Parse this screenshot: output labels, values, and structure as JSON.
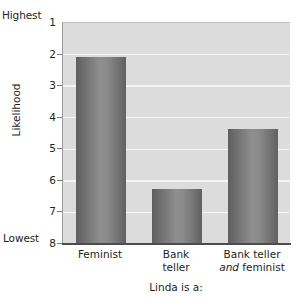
{
  "chart_data": {
    "type": "bar",
    "title": "",
    "subtitle": "",
    "xlabel": "Linda is a:",
    "ylabel": "Likelihood",
    "categories": [
      "Feminist",
      "Bank teller",
      "Bank teller and feminist"
    ],
    "values": [
      2.1,
      6.3,
      4.4
    ],
    "ylim": [
      1,
      8
    ],
    "y_axis_inverted": true,
    "y_tick_labels": [
      "1",
      "2",
      "3",
      "4",
      "5",
      "6",
      "7",
      "8"
    ],
    "y_axis_top_caption": "Highest",
    "y_axis_bottom_caption": "Lowest",
    "grid": true,
    "legend": "none",
    "series": [
      {
        "name": "Likelihood rating",
        "values": [
          2.1,
          6.3,
          4.4
        ]
      }
    ],
    "annotations": [],
    "plot_background_color": "#dcdcdc",
    "gridline_color": "#f4f4f4",
    "bar_color_dark": "#5e5e5e",
    "bar_color_light": "#8e8e8e"
  },
  "axis": {
    "highest_caption": "Highest",
    "lowest_caption": "Lowest",
    "y_title": "Likelihood",
    "x_title": "Linda is a:",
    "ticks": [
      {
        "label": "1",
        "value": 1
      },
      {
        "label": "2",
        "value": 2
      },
      {
        "label": "3",
        "value": 3
      },
      {
        "label": "4",
        "value": 4
      },
      {
        "label": "5",
        "value": 5
      },
      {
        "label": "6",
        "value": 6
      },
      {
        "label": "7",
        "value": 7
      },
      {
        "label": "8",
        "value": 8
      }
    ]
  },
  "categories": [
    {
      "line1": "Feminist",
      "line2": "",
      "line2_em": "",
      "line2_tail": ""
    },
    {
      "line1": "Bank",
      "line2": "teller",
      "line2_em": "",
      "line2_tail": ""
    },
    {
      "line1": "Bank teller",
      "line2": "",
      "line2_em": "and",
      "line2_tail": " feminist"
    }
  ]
}
